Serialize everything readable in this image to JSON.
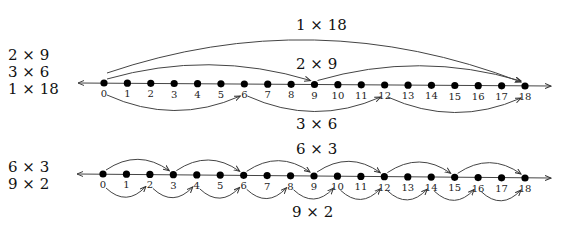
{
  "diagram": {
    "top": {
      "side_labels": [
        "2 × 9",
        "3 × 6",
        "1 × 18"
      ],
      "arc_labels": {
        "one_by_18": "1 × 18",
        "two_by_9": "2 × 9",
        "three_by_6": "3 × 6"
      },
      "ticks": [
        "0",
        "1",
        "2",
        "3",
        "4",
        "5",
        "6",
        "7",
        "8",
        "9",
        "10",
        "11",
        "12",
        "13",
        "14",
        "15",
        "16",
        "17",
        "18"
      ]
    },
    "bottom": {
      "side_labels": [
        "6 × 3",
        "9 × 2"
      ],
      "arc_labels": {
        "six_by_3": "6 × 3",
        "nine_by_2": "9 × 2"
      },
      "ticks": [
        "0",
        "1",
        "2",
        "3",
        "4",
        "5",
        "6",
        "7",
        "8",
        "9",
        "10",
        "11",
        "12",
        "13",
        "14",
        "15",
        "16",
        "17",
        "18"
      ]
    }
  }
}
